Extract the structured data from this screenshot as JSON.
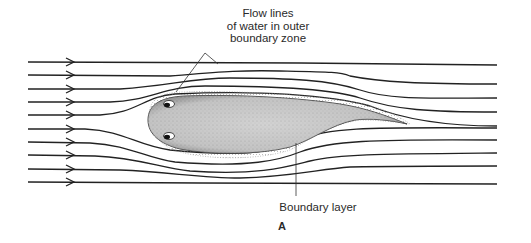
{
  "figure": {
    "panel_letter": "A",
    "labels": {
      "flow_lines": [
        "Flow lines",
        "of water in outer",
        "boundary zone"
      ],
      "boundary_layer": "Boundary layer"
    },
    "colors": {
      "line": "#222222",
      "body_fill": "#c8c8c8",
      "stipple": "#555555",
      "text": "#2a2a2a"
    },
    "flow_lines_count": 10,
    "flow_direction": "left-to-right"
  }
}
